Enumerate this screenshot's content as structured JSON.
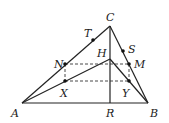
{
  "diagram": {
    "points": {
      "A": {
        "label": "A",
        "x": 22,
        "y": 103
      },
      "B": {
        "label": "B",
        "x": 148,
        "y": 103
      },
      "C": {
        "label": "C",
        "x": 110,
        "y": 26
      },
      "H": {
        "label": "H",
        "x": 110,
        "y": 59
      },
      "R": {
        "label": "R",
        "x": 110,
        "y": 103
      },
      "N": {
        "label": "N",
        "x": 65,
        "y": 64
      },
      "M": {
        "label": "M",
        "x": 129,
        "y": 64
      },
      "X": {
        "label": "X",
        "x": 65,
        "y": 81
      },
      "Y": {
        "label": "Y",
        "x": 129,
        "y": 81
      },
      "T": {
        "label": "T",
        "x": 93,
        "y": 39
      },
      "S": {
        "label": "S",
        "x": 123,
        "y": 51
      }
    },
    "solid_segments": [
      [
        "A",
        "B"
      ],
      [
        "A",
        "C"
      ],
      [
        "B",
        "C"
      ],
      [
        "C",
        "R"
      ],
      [
        "A",
        "H"
      ],
      [
        "B",
        "H"
      ]
    ],
    "dashed_segments": [
      [
        "N",
        "M"
      ],
      [
        "X",
        "Y"
      ],
      [
        "N",
        "X"
      ],
      [
        "M",
        "Y"
      ]
    ],
    "marked_points": [
      "T",
      "S",
      "N",
      "M",
      "X",
      "Y"
    ]
  }
}
